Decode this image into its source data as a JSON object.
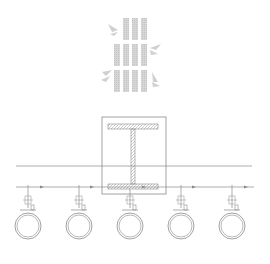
{
  "diagram": {
    "type": "pipe-hanger-support-detail",
    "colors": {
      "background": "#ffffff",
      "line": "#8a8a8a",
      "hatch": "#b0b0b0",
      "logo": "#cfcfcf"
    },
    "logo": {
      "name": "bamboo-logo"
    },
    "beam": {
      "name": "i-beam-section"
    },
    "pipes": [
      {
        "id": 1,
        "cx": 28
      },
      {
        "id": 2,
        "cx": 79
      },
      {
        "id": 3,
        "cx": 130
      },
      {
        "id": 4,
        "cx": 181
      },
      {
        "id": 5,
        "cx": 232
      }
    ]
  }
}
